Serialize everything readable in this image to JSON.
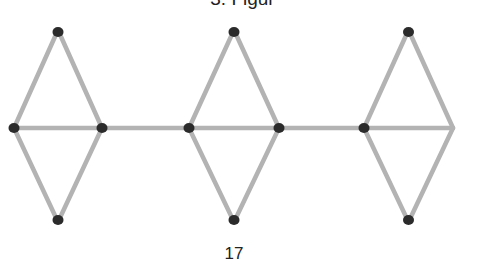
{
  "figure": {
    "title": "3. Figur",
    "caption": "17",
    "colors": {
      "stick": "#b3b3b3",
      "head": "#2b2b2b"
    },
    "diamond_count": 3,
    "connector_count": 2,
    "matchstick_count": 17
  }
}
